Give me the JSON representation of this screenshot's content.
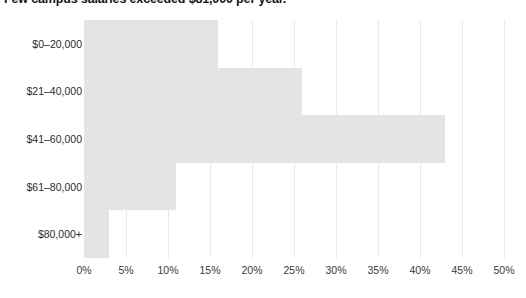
{
  "chart_data": {
    "type": "bar",
    "orientation": "horizontal",
    "title": "Few campus salaries exceeded $81,000 per year.",
    "categories": [
      "$0–20,000",
      "$21–40,000",
      "$41–60,000",
      "$61–80,000",
      "$80,000+"
    ],
    "values": [
      16,
      26,
      43,
      11,
      3
    ],
    "value_suffix": "%",
    "xlabel": "",
    "ylabel": "",
    "xlim": [
      0,
      50
    ],
    "xticks": [
      0,
      5,
      10,
      15,
      20,
      25,
      30,
      35,
      40,
      45,
      50
    ],
    "xtick_labels": [
      "0%",
      "5%",
      "10%",
      "15%",
      "20%",
      "25%",
      "30%",
      "35%",
      "40%",
      "45%",
      "50%"
    ],
    "grid": "vertical",
    "legend": "none",
    "bar_color": "#e4e4e4",
    "gridline_color": "#e9e9e9",
    "background_color": "#ffffff",
    "title_color": "#141414",
    "tick_label_color": "#3a3a3a"
  }
}
